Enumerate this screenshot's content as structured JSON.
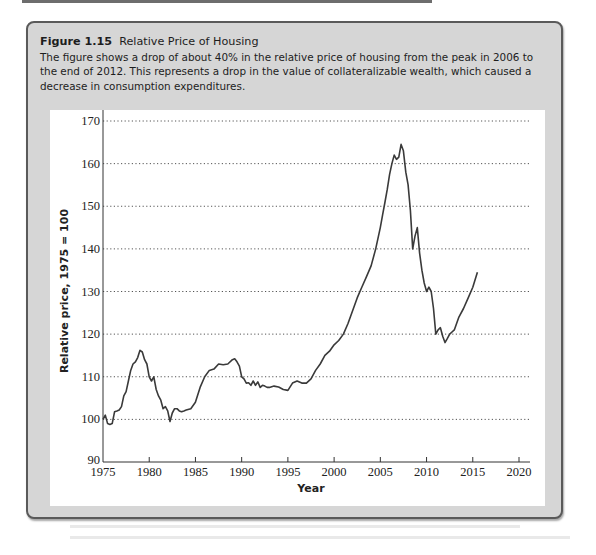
{
  "figure": {
    "number": "Figure 1.15",
    "title": "Relative Price of Housing",
    "description": "The figure shows a drop of about 40% in the relative price of housing from the peak in 2006 to the end of 2012. This represents a drop in the value of collateralizable wealth, which caused a decrease in consumption expenditures."
  },
  "colors": {
    "box_background": "#d6d6d6",
    "box_border": "#5a5a5a",
    "line": "#3a3a3a",
    "grid": "#555555"
  },
  "chart_data": {
    "type": "line",
    "title": "Relative Price of Housing",
    "xlabel": "Year",
    "ylabel": "Relative price, 1975 = 100",
    "xlim": [
      1975,
      2020
    ],
    "ylim": [
      90,
      170
    ],
    "xticks": [
      1975,
      1980,
      1985,
      1990,
      1995,
      2000,
      2005,
      2010,
      2015,
      2020
    ],
    "yticks": [
      90,
      100,
      110,
      120,
      130,
      140,
      150,
      160,
      170
    ],
    "grid": "horizontal dotted",
    "legend": "none",
    "series": [
      {
        "name": "Relative price of housing",
        "x": [
          1975.0,
          1975.25,
          1975.5,
          1975.75,
          1976.0,
          1976.25,
          1976.5,
          1976.75,
          1977.0,
          1977.25,
          1977.5,
          1977.75,
          1978.0,
          1978.25,
          1978.5,
          1978.75,
          1979.0,
          1979.25,
          1979.5,
          1979.75,
          1980.0,
          1980.25,
          1980.5,
          1980.75,
          1981.0,
          1981.25,
          1981.5,
          1981.75,
          1982.0,
          1982.25,
          1982.5,
          1982.75,
          1983.0,
          1983.25,
          1983.5,
          1983.75,
          1984.0,
          1984.5,
          1985.0,
          1985.5,
          1986.0,
          1986.5,
          1987.0,
          1987.5,
          1988.0,
          1988.5,
          1989.0,
          1989.25,
          1989.5,
          1989.75,
          1990.0,
          1990.25,
          1990.5,
          1990.75,
          1991.0,
          1991.25,
          1991.5,
          1991.75,
          1992.0,
          1992.25,
          1992.5,
          1992.75,
          1993.0,
          1993.5,
          1994.0,
          1994.5,
          1995.0,
          1995.5,
          1996.0,
          1996.5,
          1997.0,
          1997.5,
          1998.0,
          1998.5,
          1999.0,
          1999.5,
          2000.0,
          2000.5,
          2001.0,
          2001.5,
          2002.0,
          2002.5,
          2003.0,
          2003.5,
          2004.0,
          2004.5,
          2005.0,
          2005.25,
          2005.5,
          2005.75,
          2006.0,
          2006.25,
          2006.5,
          2006.75,
          2007.0,
          2007.25,
          2007.5,
          2007.75,
          2008.0,
          2008.25,
          2008.5,
          2008.75,
          2009.0,
          2009.25,
          2009.5,
          2009.75,
          2010.0,
          2010.25,
          2010.5,
          2010.75,
          2011.0,
          2011.25,
          2011.5,
          2011.75,
          2012.0,
          2012.25,
          2012.5,
          2012.75,
          2013.0,
          2013.5,
          2014.0,
          2014.5,
          2015.0,
          2015.5
        ],
        "y": [
          100.0,
          101.0,
          99.0,
          98.8,
          99.0,
          101.8,
          102.0,
          102.2,
          103.0,
          105.5,
          106.5,
          109.0,
          111.5,
          113.0,
          113.5,
          114.5,
          116.2,
          115.8,
          114.0,
          113.0,
          110.0,
          109.0,
          110.0,
          107.0,
          105.5,
          104.5,
          102.5,
          103.0,
          102.0,
          99.5,
          101.5,
          102.5,
          102.5,
          102.0,
          101.8,
          102.0,
          102.2,
          102.5,
          104.0,
          107.5,
          110.0,
          111.5,
          111.8,
          113.0,
          112.8,
          113.0,
          114.0,
          114.2,
          113.5,
          112.5,
          110.0,
          109.5,
          108.5,
          108.6,
          108.0,
          109.0,
          108.0,
          108.8,
          107.5,
          108.0,
          107.8,
          107.5,
          107.5,
          107.8,
          107.6,
          107.0,
          106.8,
          108.5,
          109.0,
          108.5,
          108.5,
          109.5,
          111.5,
          113.0,
          115.0,
          116.0,
          117.5,
          118.5,
          120.0,
          122.5,
          125.5,
          128.5,
          131.0,
          133.5,
          136.0,
          140.0,
          145.0,
          148.0,
          151.0,
          154.0,
          157.5,
          160.0,
          162.0,
          161.0,
          161.5,
          164.5,
          163.0,
          158.0,
          155.0,
          149.0,
          140.0,
          143.0,
          145.0,
          139.0,
          135.0,
          132.0,
          130.0,
          131.0,
          130.0,
          126.0,
          120.0,
          121.0,
          121.5,
          119.5,
          118.0,
          119.0,
          120.0,
          120.5,
          121.0,
          124.0,
          126.0,
          128.5,
          131.0,
          134.5
        ]
      }
    ]
  }
}
